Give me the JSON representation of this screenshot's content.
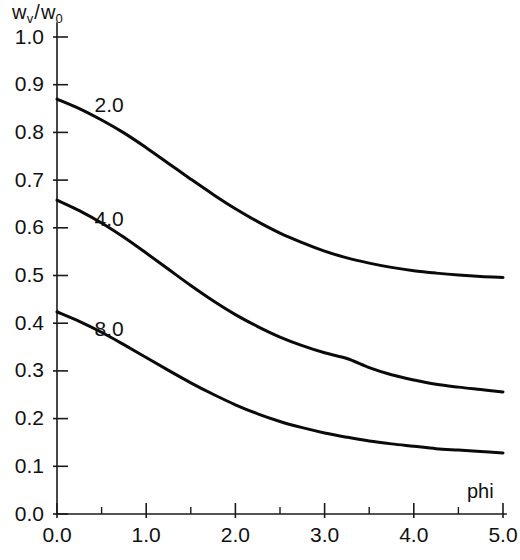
{
  "chart_data": {
    "type": "line",
    "title": "",
    "subtitle": "",
    "xlabel": "phi",
    "ylabel": "w_v / w_0",
    "ylabel_parts": {
      "num_base": "w",
      "num_sub": "v",
      "separator": "/",
      "den_base": "w",
      "den_sub": "0"
    },
    "xlim": [
      0.0,
      5.0
    ],
    "ylim": [
      0.0,
      1.0
    ],
    "grid": false,
    "legend_position": "inline-curve-labels",
    "x_ticks": [
      0.0,
      1.0,
      2.0,
      3.0,
      4.0,
      5.0
    ],
    "x_tick_labels": [
      "0.0",
      "1.0",
      "2.0",
      "3.0",
      "4.0",
      "5.0"
    ],
    "x_minor_ticks": [
      0.5,
      1.5,
      2.5,
      3.5,
      4.5
    ],
    "y_ticks": [
      0.0,
      0.1,
      0.2,
      0.3,
      0.4,
      0.5,
      0.6,
      0.7,
      0.8,
      0.9,
      1.0
    ],
    "y_tick_labels": [
      "0.0",
      "0.1",
      "0.2",
      "0.3",
      "0.4",
      "0.5",
      "0.6",
      "0.7",
      "0.8",
      "0.9",
      "1.0"
    ],
    "x": [
      0.0,
      0.25,
      0.5,
      0.75,
      1.0,
      1.25,
      1.5,
      1.75,
      2.0,
      2.25,
      2.5,
      2.75,
      3.0,
      3.25,
      3.5,
      3.75,
      4.0,
      4.25,
      4.5,
      4.75,
      5.0
    ],
    "series": [
      {
        "name": "2.0",
        "label": "2.0",
        "color": "#0a0a0a",
        "label_x": 0.42,
        "label_y": 0.855,
        "values": [
          0.87,
          0.85,
          0.826,
          0.799,
          0.768,
          0.735,
          0.702,
          0.67,
          0.64,
          0.613,
          0.589,
          0.569,
          0.551,
          0.537,
          0.526,
          0.517,
          0.51,
          0.505,
          0.501,
          0.498,
          0.496
        ]
      },
      {
        "name": "4.0",
        "label": "4.0",
        "color": "#0a0a0a",
        "label_x": 0.42,
        "label_y": 0.615,
        "values": [
          0.658,
          0.636,
          0.61,
          0.58,
          0.547,
          0.513,
          0.479,
          0.447,
          0.418,
          0.393,
          0.371,
          0.353,
          0.338,
          0.326,
          0.307,
          0.292,
          0.281,
          0.272,
          0.266,
          0.261,
          0.256
        ]
      },
      {
        "name": "8.0",
        "label": "8.0",
        "color": "#0a0a0a",
        "label_x": 0.42,
        "label_y": 0.385,
        "values": [
          0.424,
          0.404,
          0.381,
          0.355,
          0.328,
          0.301,
          0.275,
          0.251,
          0.229,
          0.21,
          0.194,
          0.181,
          0.17,
          0.161,
          0.153,
          0.147,
          0.142,
          0.137,
          0.134,
          0.131,
          0.128
        ]
      }
    ]
  }
}
